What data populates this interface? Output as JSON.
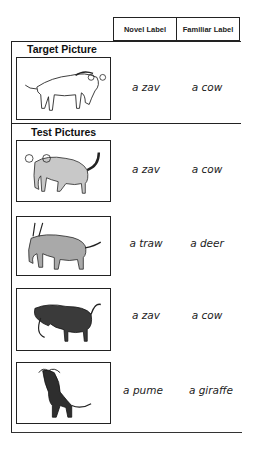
{
  "header": {
    "columns": [
      "Novel Label",
      "Familiar Label"
    ]
  },
  "target": {
    "title": "Target Picture",
    "picture": {
      "icon": "line-drawn-animal-icon",
      "fill": "#ffffff"
    },
    "novel_label": "a zav",
    "familiar_label": "a cow"
  },
  "test": {
    "title": "Test Pictures",
    "items": [
      {
        "picture": {
          "icon": "gray-animal-spiral-horns-icon",
          "fill": "#c8c8c8"
        },
        "novel_label": "a zav",
        "familiar_label": "a cow"
      },
      {
        "picture": {
          "icon": "gray-animal-straight-horns-icon",
          "fill": "#a9a9a9"
        },
        "novel_label": "a traw",
        "familiar_label": "a deer"
      },
      {
        "picture": {
          "icon": "dark-textured-animal-icon",
          "fill": "#3a3a3a"
        },
        "novel_label": "a zav",
        "familiar_label": "a cow"
      },
      {
        "picture": {
          "icon": "dark-textured-tall-animal-icon",
          "fill": "#2e2e2e"
        },
        "novel_label": "a pume",
        "familiar_label": "a giraffe"
      }
    ]
  }
}
